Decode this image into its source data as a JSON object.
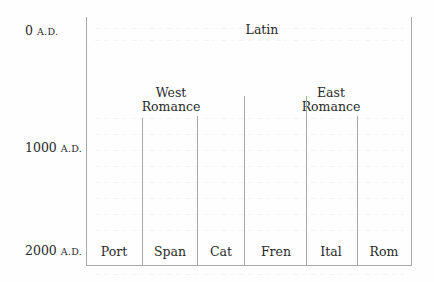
{
  "diagram": {
    "type": "language-family-timeline",
    "time_axis": [
      {
        "year": "0",
        "era": "A.D."
      },
      {
        "year": "1000",
        "era": "A.D."
      },
      {
        "year": "2000",
        "era": "A.D."
      }
    ],
    "root": {
      "label": "Latin"
    },
    "groups": [
      {
        "line1": "West",
        "line2": "Romance",
        "members": [
          "Port",
          "Span",
          "Cat",
          "Fren"
        ]
      },
      {
        "line1": "East",
        "line2": "Romance",
        "members": [
          "Ital",
          "Rom"
        ]
      }
    ],
    "languages": [
      {
        "label": "Port",
        "full_name": "Portuguese"
      },
      {
        "label": "Span",
        "full_name": "Spanish"
      },
      {
        "label": "Cat",
        "full_name": "Catalan"
      },
      {
        "label": "Fren",
        "full_name": "French"
      },
      {
        "label": "Ital",
        "full_name": "Italian"
      },
      {
        "label": "Rom",
        "full_name": "Romanian"
      }
    ],
    "colors": {
      "line": "#a8a8a8",
      "text": "#2a2a2a",
      "background": "#fefefe"
    }
  }
}
